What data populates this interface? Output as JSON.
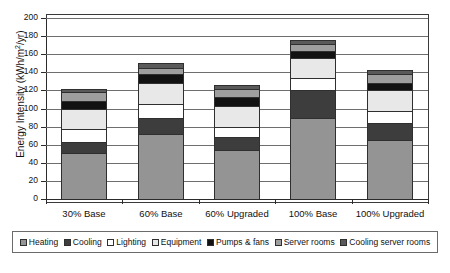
{
  "chart_data": {
    "type": "bar",
    "stacked": true,
    "title": "",
    "xlabel": "",
    "ylabel": "Energy Intensity (kWh/m2/yr)",
    "ylabel_parts": {
      "main": "Energy Intensity (kWh/m",
      "sup": "2",
      "tail": "/yr)"
    },
    "ylim": [
      0,
      200
    ],
    "ytick_step": 20,
    "yticks": [
      0,
      20,
      40,
      60,
      80,
      100,
      120,
      140,
      160,
      180,
      200
    ],
    "ytick_labels": [
      "0",
      "20",
      "40",
      "60",
      "80",
      "100",
      "120",
      "140",
      "160",
      "180",
      "200"
    ],
    "grid": true,
    "grid_axis": "y",
    "legend_position": "below-plot",
    "categories": [
      "30% Base",
      "60% Base",
      "60% Upgraded",
      "100% Base",
      "100% Upgraded"
    ],
    "series": [
      {
        "name": "Heating",
        "color": "#949494",
        "values": [
          51,
          72,
          54,
          89,
          65
        ]
      },
      {
        "name": "Cooling",
        "color": "#3d3d3d",
        "values": [
          12,
          18,
          14,
          31,
          19
        ]
      },
      {
        "name": "Lighting",
        "color": "#ffffff",
        "values": [
          14,
          15,
          12,
          14,
          13
        ]
      },
      {
        "name": "Equipment",
        "color": "#e8e8e8",
        "values": [
          23,
          23,
          23,
          22,
          23
        ]
      },
      {
        "name": "Pumps & fans",
        "color": "#121212",
        "values": [
          8,
          10,
          10,
          8,
          8
        ]
      },
      {
        "name": "Server rooms",
        "color": "#9e9e9e",
        "values": [
          10,
          7,
          9,
          7,
          10
        ]
      },
      {
        "name": "Cooling server rooms",
        "color": "#5a5a5a",
        "values": [
          4,
          5,
          4,
          5,
          5
        ]
      }
    ],
    "totals": [
      122,
      150,
      126,
      176,
      143
    ]
  },
  "legend": {
    "items": [
      {
        "label": "Heating",
        "color": "#949494"
      },
      {
        "label": "Cooling",
        "color": "#3d3d3d"
      },
      {
        "label": "Lighting",
        "color": "#ffffff"
      },
      {
        "label": "Equipment",
        "color": "#e8e8e8"
      },
      {
        "label": "Pumps & fans",
        "color": "#121212"
      },
      {
        "label": "Server rooms",
        "color": "#9e9e9e"
      },
      {
        "label": "Cooling server rooms",
        "color": "#5a5a5a"
      }
    ]
  },
  "colors": {
    "plot_border": "#3a3a3a",
    "gridline": "#6e6e6e",
    "axis": "#2b2b2b",
    "background": "#ffffff",
    "text": "#111111"
  }
}
